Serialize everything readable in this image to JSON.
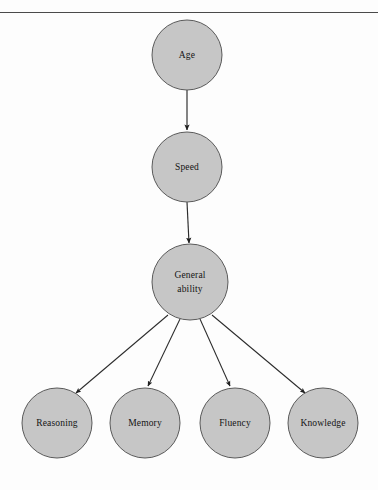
{
  "figure": {
    "title_rule": "top-horizontal-rule",
    "background_color": "#fdfdfd",
    "node_fill_color": "#c6c6c6",
    "node_stroke_color": "#5a5a5a",
    "edge_color": "#2b2b2b",
    "label_color": "#141414"
  },
  "nodes": [
    {
      "id": "age",
      "label": "Age",
      "label_line1": "Age",
      "label_line2": "",
      "cx": 187,
      "cy": 55,
      "r": 35
    },
    {
      "id": "speed",
      "label": "Speed",
      "label_line1": "Speed",
      "label_line2": "",
      "cx": 187,
      "cy": 167,
      "r": 35
    },
    {
      "id": "general",
      "label": "General ability",
      "label_line1": "General",
      "label_line2": "ability",
      "cx": 190,
      "cy": 282,
      "r": 38
    },
    {
      "id": "reasoning",
      "label": "Reasoning",
      "label_line1": "Reasoning",
      "label_line2": "",
      "cx": 57,
      "cy": 423,
      "r": 35
    },
    {
      "id": "memory",
      "label": "Memory",
      "label_line1": "Memory",
      "label_line2": "",
      "cx": 145,
      "cy": 423,
      "r": 35
    },
    {
      "id": "fluency",
      "label": "Fluency",
      "label_line1": "Fluency",
      "label_line2": "",
      "cx": 235,
      "cy": 423,
      "r": 35
    },
    {
      "id": "knowledge",
      "label": "Knowledge",
      "label_line1": "Knowledge",
      "label_line2": "",
      "cx": 323,
      "cy": 423,
      "r": 35
    }
  ],
  "edges": [
    {
      "id": "age-to-speed",
      "from": "age",
      "to": "speed",
      "x1": 187,
      "y1": 90,
      "x2": 187,
      "y2": 130
    },
    {
      "id": "speed-to-general",
      "from": "speed",
      "to": "general",
      "x1": 187,
      "y1": 202,
      "x2": 189,
      "y2": 243
    },
    {
      "id": "general-to-reasoning",
      "from": "general",
      "to": "reasoning",
      "x1": 168,
      "y1": 315,
      "x2": 76,
      "y2": 393
    },
    {
      "id": "general-to-memory",
      "from": "general",
      "to": "memory",
      "x1": 180,
      "y1": 319,
      "x2": 148,
      "y2": 386
    },
    {
      "id": "general-to-fluency",
      "from": "general",
      "to": "fluency",
      "x1": 200,
      "y1": 319,
      "x2": 230,
      "y2": 386
    },
    {
      "id": "general-to-knowledge",
      "from": "general",
      "to": "knowledge",
      "x1": 212,
      "y1": 315,
      "x2": 305,
      "y2": 393
    }
  ]
}
